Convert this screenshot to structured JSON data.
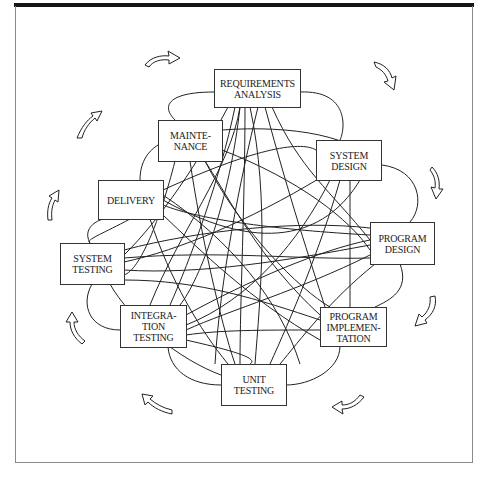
{
  "diagram": {
    "type": "cyclic-process-with-interconnections",
    "style": {
      "line_color": "#222222",
      "box_border_color": "#333333",
      "frame_color": "#8a8a8a",
      "topbar_color": "#151515"
    },
    "nodes": [
      {
        "id": "requirements",
        "lines": [
          "REQUIREMENTS",
          "ANALYSIS"
        ]
      },
      {
        "id": "system_design",
        "lines": [
          "SYSTEM",
          "DESIGN"
        ]
      },
      {
        "id": "program_design",
        "lines": [
          "PROGRAM",
          "DESIGN"
        ]
      },
      {
        "id": "program_implementation",
        "lines": [
          "PROGRAM",
          "IMPLEMEN-",
          "TATION"
        ]
      },
      {
        "id": "unit_testing",
        "lines": [
          "UNIT",
          "TESTING"
        ]
      },
      {
        "id": "integration_testing",
        "lines": [
          "INTEGRA-",
          "TION",
          "TESTING"
        ]
      },
      {
        "id": "system_testing",
        "lines": [
          "SYSTEM",
          "TESTING"
        ]
      },
      {
        "id": "delivery",
        "lines": [
          "DELIVERY"
        ]
      },
      {
        "id": "maintenance",
        "lines": [
          "MAINTE-",
          "NANCE"
        ]
      }
    ],
    "flow_direction": "clockwise",
    "outer_arrows": 12,
    "interconnections": "every phase linked to many other phases by curved lines"
  }
}
